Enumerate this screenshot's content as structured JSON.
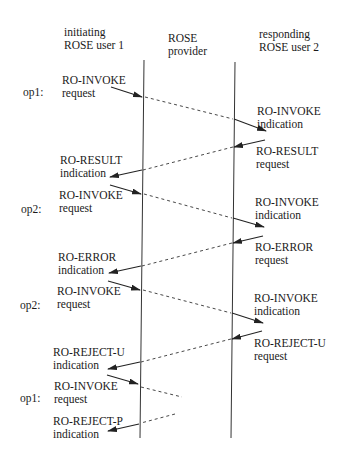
{
  "headers": {
    "initiator": {
      "line1": "initiating",
      "line2": "ROSE user 1"
    },
    "provider": {
      "line1": "ROSE",
      "line2": "provider"
    },
    "responder": {
      "line1": "responding",
      "line2": "ROSE user 2"
    }
  },
  "operations": [
    {
      "label": "op1:",
      "left": {
        "line1": "RO-INVOKE",
        "line2": "request"
      },
      "right": {
        "line1": "RO-INVOKE",
        "line2": "indication"
      }
    },
    {
      "label": "",
      "right": {
        "line1": "RO-RESULT",
        "line2": "request"
      },
      "left": {
        "line1": "RO-RESULT",
        "line2": "indication"
      }
    },
    {
      "label": "op2:",
      "left": {
        "line1": "RO-INVOKE",
        "line2": "request"
      },
      "right": {
        "line1": "RO-INVOKE",
        "line2": "indication"
      }
    },
    {
      "label": "",
      "right": {
        "line1": "RO-ERROR",
        "line2": "request"
      },
      "left": {
        "line1": "RO-ERROR",
        "line2": "indication"
      }
    },
    {
      "label": "op2:",
      "left": {
        "line1": "RO-INVOKE",
        "line2": "request"
      },
      "right": {
        "line1": "RO-INVOKE",
        "line2": "indication"
      }
    },
    {
      "label": "",
      "right": {
        "line1": "RO-REJECT-U",
        "line2": "request"
      },
      "left": {
        "line1": "RO-REJECT-U",
        "line2": "indication"
      }
    },
    {
      "label": "op1:",
      "left": {
        "line1": "RO-INVOKE",
        "line2": "request"
      }
    },
    {
      "label": "",
      "left": {
        "line1": "RO-REJECT-P",
        "line2": "indication"
      }
    }
  ],
  "colors": {
    "line": "#222222",
    "dashed": "#333333",
    "text": "#1a1a1a"
  }
}
